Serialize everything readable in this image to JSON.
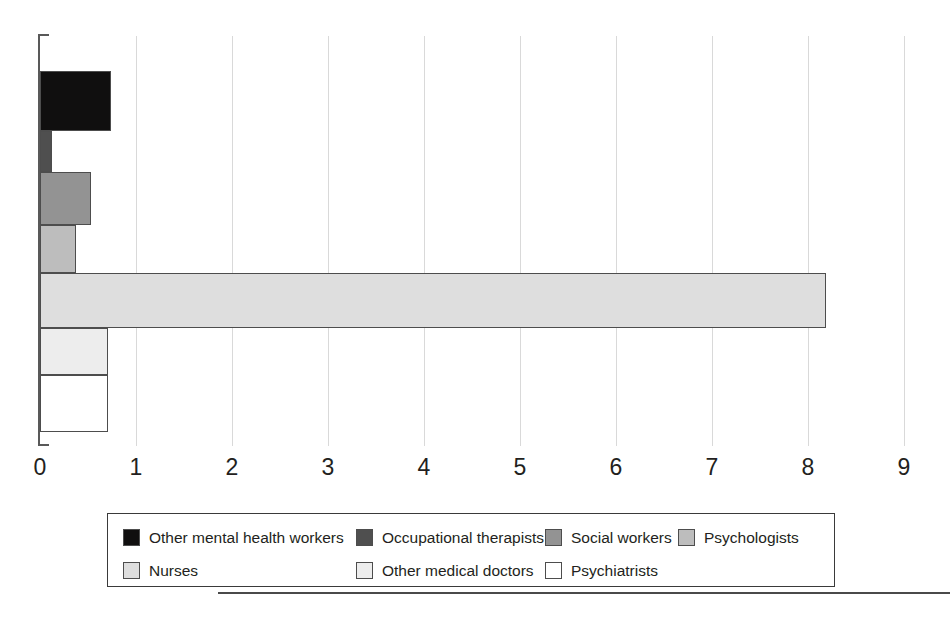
{
  "chart_data": {
    "type": "bar",
    "orientation": "horizontal",
    "title": "",
    "xlabel": "",
    "ylabel": "",
    "xlim": [
      0,
      9
    ],
    "xticks": [
      "0",
      "1",
      "2",
      "3",
      "4",
      "5",
      "6",
      "7",
      "8",
      "9"
    ],
    "grid": true,
    "legend_position": "bottom",
    "categories": [
      "Other mental health workers",
      "Occupational therapists",
      "Social workers",
      "Psychologists",
      "Nurses",
      "Other medical doctors",
      "Psychiatrists"
    ],
    "values": [
      0.74,
      0.12,
      0.53,
      0.38,
      8.19,
      0.71,
      0.71
    ],
    "colors": [
      "#100f0f",
      "#4f4f4f",
      "#939393",
      "#bdbdbd",
      "#dedede",
      "#ededed",
      "#ffffff"
    ],
    "bar_edge_color": "#4d4d4d",
    "gridline_color": "#d9d9d9",
    "axis_color": "#595959",
    "bars": [
      {
        "label": "Other mental health workers",
        "value": 0.74,
        "color": "#100f0f",
        "band_top": 71,
        "band_height": 60
      },
      {
        "label": "Occupational therapists",
        "value": 0.12,
        "color": "#4f4f4f",
        "band_top": 131,
        "band_height": 41
      },
      {
        "label": "Social workers",
        "value": 0.53,
        "color": "#939393",
        "band_top": 172,
        "band_height": 53
      },
      {
        "label": "Psychologists",
        "value": 0.38,
        "color": "#bdbdbd",
        "band_top": 225,
        "band_height": 48
      },
      {
        "label": "Nurses",
        "value": 8.19,
        "color": "#dedede",
        "band_top": 273,
        "band_height": 55
      },
      {
        "label": "Other medical doctors",
        "value": 0.71,
        "color": "#ededed",
        "band_top": 328,
        "band_height": 47
      },
      {
        "label": "Psychiatrists",
        "value": 0.71,
        "color": "#ffffff",
        "band_top": 375,
        "band_height": 57
      }
    ]
  },
  "legend": {
    "rows": [
      [
        {
          "label": "Other mental health workers",
          "color": "#100f0f",
          "x": 15
        },
        {
          "label": "Occupational therapists",
          "color": "#4f4f4f",
          "x": 248
        },
        {
          "label": "Social workers",
          "color": "#939393",
          "x": 437
        },
        {
          "label": "Psychologists",
          "color": "#bdbdbd",
          "x": 570
        }
      ],
      [
        {
          "label": "Nurses",
          "color": "#dedede",
          "x": 15
        },
        {
          "label": "Other medical doctors",
          "color": "#ededed",
          "x": 248
        },
        {
          "label": "Psychiatrists",
          "color": "#ffffff",
          "x": 437
        }
      ]
    ]
  },
  "caption": {
    "fragment": ""
  }
}
